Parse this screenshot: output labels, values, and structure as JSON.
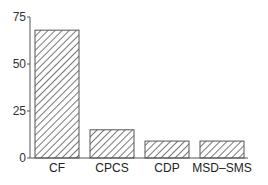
{
  "chart_data": {
    "type": "bar",
    "title": "",
    "xlabel": "",
    "ylabel": "",
    "categories": [
      "CF",
      "CPCS",
      "CDP",
      "MSD–SMS"
    ],
    "values": [
      68,
      15,
      9,
      9
    ],
    "ylim": [
      0,
      75
    ],
    "yticks": [
      0,
      25,
      50,
      75
    ],
    "ytick_labels": [
      "0",
      "25",
      "50",
      "75"
    ],
    "grid": false,
    "legend": null,
    "bar_fill": "diagonal-hatch",
    "colors": {
      "bar_stroke": "#555555",
      "hatch": "#555555",
      "axis": "#555555"
    }
  }
}
